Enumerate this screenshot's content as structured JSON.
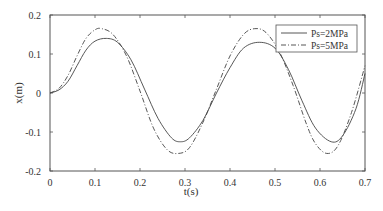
{
  "chart_data": {
    "type": "line",
    "title": "",
    "xlabel": "t(s)",
    "ylabel": "x(m)",
    "xlim": [
      0,
      0.7
    ],
    "ylim": [
      -0.2,
      0.2
    ],
    "xticks": [
      "0",
      "0.1",
      "0.2",
      "0.3",
      "0.4",
      "0.5",
      "0.6",
      "0.7"
    ],
    "yticks": [
      "0.2",
      "0.1",
      "0",
      "-0.1",
      "-0.2"
    ],
    "grid": false,
    "legend_position": "upper right",
    "series": [
      {
        "name": "Ps=2MPa",
        "style": "solid",
        "x": [
          0,
          0.02,
          0.04,
          0.06,
          0.08,
          0.1,
          0.125,
          0.15,
          0.18,
          0.21,
          0.24,
          0.27,
          0.29,
          0.31,
          0.34,
          0.37,
          0.4,
          0.43,
          0.465,
          0.5,
          0.53,
          0.56,
          0.59,
          0.625,
          0.65,
          0.68,
          0.7
        ],
        "y": [
          0,
          0.008,
          0.03,
          0.07,
          0.11,
          0.133,
          0.14,
          0.13,
          0.085,
          0.01,
          -0.065,
          -0.115,
          -0.125,
          -0.115,
          -0.07,
          0.0,
          0.065,
          0.115,
          0.13,
          0.115,
          0.06,
          -0.02,
          -0.09,
          -0.125,
          -0.11,
          -0.04,
          0.05
        ]
      },
      {
        "name": "Ps=5MPa",
        "style": "dash-dot",
        "x": [
          0,
          0.02,
          0.04,
          0.06,
          0.08,
          0.1,
          0.115,
          0.14,
          0.17,
          0.2,
          0.23,
          0.26,
          0.285,
          0.31,
          0.34,
          0.37,
          0.4,
          0.43,
          0.455,
          0.48,
          0.51,
          0.54,
          0.57,
          0.59,
          0.615,
          0.64,
          0.67,
          0.7
        ],
        "y": [
          0,
          0.012,
          0.045,
          0.095,
          0.14,
          0.162,
          0.165,
          0.15,
          0.095,
          0.005,
          -0.09,
          -0.145,
          -0.155,
          -0.14,
          -0.075,
          0.01,
          0.095,
          0.15,
          0.165,
          0.155,
          0.105,
          0.02,
          -0.08,
          -0.13,
          -0.155,
          -0.135,
          -0.05,
          0.07
        ]
      }
    ]
  },
  "colors": {
    "axis": "#555555",
    "series_solid": "#444444",
    "series_dashdot": "#444444"
  }
}
